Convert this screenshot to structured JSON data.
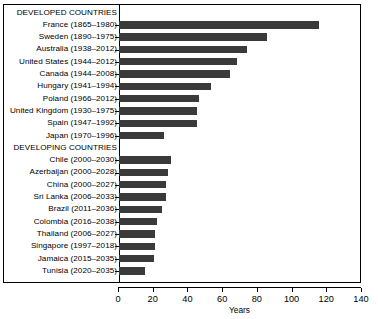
{
  "chart_data": {
    "type": "bar",
    "orientation": "horizontal",
    "title": "",
    "xlabel": "Years",
    "ylabel": "",
    "xlim": [
      0,
      140
    ],
    "xticks": [
      0,
      20,
      40,
      60,
      80,
      100,
      120,
      140
    ],
    "grid": false,
    "legend": null,
    "bar_color": "#3a3a3a",
    "groups": [
      {
        "header": "DEVELOPED COUNTRIES",
        "categories": [
          "France (1865–1980)",
          "Sweden (1890–1975)",
          "Australia (1938–2012)",
          "United States (1944–2012)",
          "Canada (1944–2008)",
          "Hungary (1941–1994)",
          "Poland (1966–2012)",
          "United Kingdom (1930–1975)",
          "Spain (1947–1992)",
          "Japan (1970–1996)"
        ],
        "values": [
          115,
          85,
          74,
          68,
          64,
          53,
          46,
          45,
          45,
          26
        ]
      },
      {
        "header": "DEVELOPING COUNTRIES",
        "categories": [
          "Chile (2000–2030)",
          "Azerbaijan (2000–2028)",
          "China (2000–2027)",
          "Sri Lanka (2006–2033)",
          "Brazil (2011–2036)",
          "Colombia (2016–2038)",
          "Thailand (2006–2027)",
          "Singapore (1997–2018)",
          "Jamaica (2015–2035)",
          "Tunisia (2020–2035)"
        ],
        "values": [
          30,
          28,
          27,
          27,
          25,
          22,
          21,
          21,
          20,
          15
        ]
      }
    ]
  }
}
